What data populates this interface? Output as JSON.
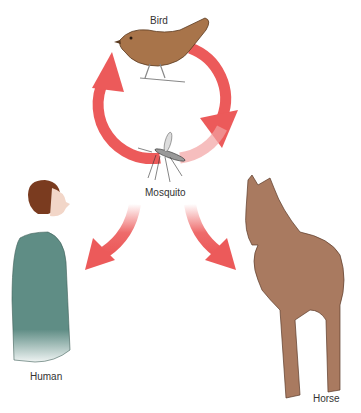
{
  "diagram": {
    "nodes": [
      {
        "id": "bird",
        "label": "Bird"
      },
      {
        "id": "mosquito",
        "label": "Mosquito"
      },
      {
        "id": "human",
        "label": "Human"
      },
      {
        "id": "horse",
        "label": "Horse"
      }
    ],
    "edges": [
      {
        "from": "bird",
        "to": "mosquito",
        "style": "cycle-arrow"
      },
      {
        "from": "mosquito",
        "to": "bird",
        "style": "cycle-arrow"
      },
      {
        "from": "mosquito",
        "to": "human",
        "style": "dead-end-arrow"
      },
      {
        "from": "mosquito",
        "to": "horse",
        "style": "dead-end-arrow"
      }
    ],
    "colors": {
      "arrow": "#ec5a5a",
      "bird": "#a8744a",
      "human_dress": "#5f8d85",
      "human_hair": "#7a3b1f",
      "horse": "#a97a60",
      "text": "#333333"
    }
  }
}
